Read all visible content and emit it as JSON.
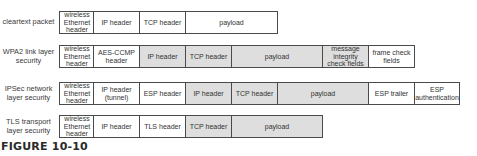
{
  "colors": {
    "encrypted_fill": "#dedede",
    "plain_fill": "#ffffff",
    "border": "#4a4a4a"
  },
  "rows": [
    {
      "label": "cleartext packet",
      "cells": [
        {
          "text": "wireless Ethernet header",
          "shaded": false
        },
        {
          "text": "IP header",
          "shaded": false
        },
        {
          "text": "TCP header",
          "shaded": false
        },
        {
          "text": "payload",
          "shaded": false
        }
      ]
    },
    {
      "label": "WPA2 link layer security",
      "cells": [
        {
          "text": "wireless Ethernet header",
          "shaded": false
        },
        {
          "text": "AES-CCMP header",
          "shaded": false
        },
        {
          "text": "IP header",
          "shaded": true
        },
        {
          "text": "TCP header",
          "shaded": true
        },
        {
          "text": "payload",
          "shaded": true
        },
        {
          "text": "message integrity check fields",
          "shaded": true
        },
        {
          "text": "frame check fields",
          "shaded": false
        }
      ]
    },
    {
      "label": "IPSec network layer security",
      "cells": [
        {
          "text": "wireless Ethernet header",
          "shaded": false
        },
        {
          "text": "IP header (tunnel)",
          "shaded": false
        },
        {
          "text": "ESP header",
          "shaded": false
        },
        {
          "text": "IP header",
          "shaded": true
        },
        {
          "text": "TCP header",
          "shaded": true
        },
        {
          "text": "payload",
          "shaded": true
        },
        {
          "text": "ESP trailer",
          "shaded": false
        },
        {
          "text": "ESP authentication",
          "shaded": false
        }
      ]
    },
    {
      "label": "TLS transport layer security",
      "cells": [
        {
          "text": "wireless Ethernet header",
          "shaded": false
        },
        {
          "text": "IP header",
          "shaded": false
        },
        {
          "text": "TLS header",
          "shaded": false
        },
        {
          "text": "TCP header",
          "shaded": true
        },
        {
          "text": "payload",
          "shaded": true
        }
      ]
    }
  ],
  "caption": "FIGURE 10-10"
}
